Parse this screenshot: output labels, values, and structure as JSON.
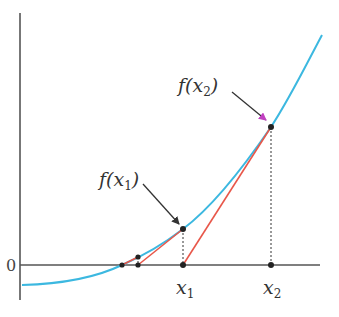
{
  "diagram": {
    "colors": {
      "curve": "#3cb8e0",
      "tangent": "#e8574a",
      "axis": "#555555",
      "point": "#222222",
      "arrow": "#333333",
      "arrow_tip_accent": "#c040c0"
    },
    "axis_labels": {
      "origin": "0"
    },
    "labels": {
      "x1": "x",
      "x1_sub": "1",
      "x2": "x",
      "x2_sub": "2",
      "fx1_prefix": "f(",
      "fx1_var": "x",
      "fx1_sub": "1",
      "fx1_suffix": ")",
      "fx2_prefix": "f(",
      "fx2_var": "x",
      "fx2_sub": "2",
      "fx2_suffix": ")"
    },
    "points": [
      {
        "name": "x2",
        "x": 271,
        "y": 265
      },
      {
        "name": "f(x2)",
        "x": 271,
        "y": 127
      },
      {
        "name": "x1",
        "x": 183,
        "y": 265
      },
      {
        "name": "f(x1)",
        "x": 183,
        "y": 229
      },
      {
        "name": "x3",
        "x": 138,
        "y": 265
      },
      {
        "name": "f(x3)",
        "x": 138,
        "y": 257
      },
      {
        "name": "root",
        "x": 122,
        "y": 265
      }
    ]
  }
}
